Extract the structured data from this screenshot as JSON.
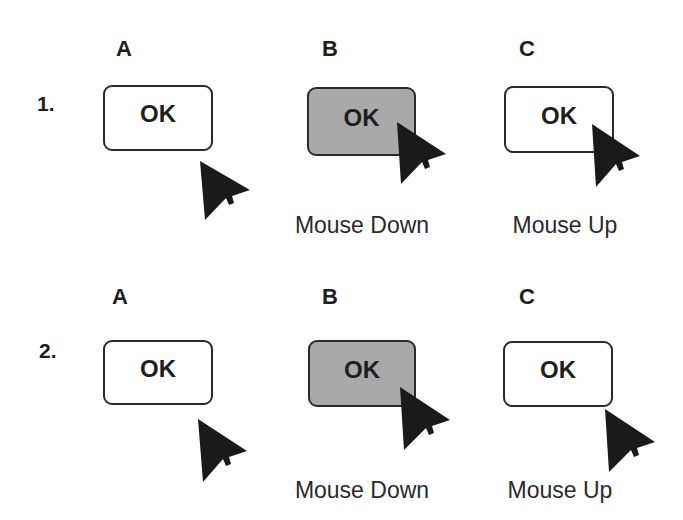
{
  "columns": [
    "A",
    "B",
    "C"
  ],
  "rows": [
    {
      "label": "1.",
      "buttons": [
        {
          "column": "A",
          "label": "OK",
          "state": "normal"
        },
        {
          "column": "B",
          "label": "OK",
          "state": "pressed"
        },
        {
          "column": "C",
          "label": "OK",
          "state": "normal"
        }
      ],
      "captions": {
        "B": "Mouse Down",
        "C": "Mouse Up"
      }
    },
    {
      "label": "2.",
      "buttons": [
        {
          "column": "A",
          "label": "OK",
          "state": "normal"
        },
        {
          "column": "B",
          "label": "OK",
          "state": "pressed"
        },
        {
          "column": "C",
          "label": "OK",
          "state": "normal"
        }
      ],
      "captions": {
        "B": "Mouse Down",
        "C": "Mouse Up"
      }
    }
  ],
  "colors": {
    "pressed_fill": "#a9a9a9",
    "border": "#2a2a2a",
    "cursor": "#1a1a1a"
  }
}
